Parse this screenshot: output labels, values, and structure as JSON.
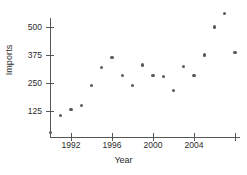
{
  "chart_data": {
    "type": "scatter",
    "title": "",
    "xlabel": "Year",
    "ylabel": "Imports",
    "xlim": [
      1989.4,
      2008.6
    ],
    "ylim": [
      0,
      580
    ],
    "grid": false,
    "legend": null,
    "xticks": [
      1992,
      1996,
      2000,
      2004,
      2008
    ],
    "xtick_labels": [
      "1992",
      "1996",
      "2000",
      "2004",
      ""
    ],
    "yticks": [
      125,
      250,
      375,
      500
    ],
    "ytick_labels": [
      "125",
      "250",
      "375",
      "500"
    ],
    "marker": {
      "shape": "circle",
      "color": "#5a5a5a",
      "size": 3.2
    },
    "points": [
      {
        "x": 1990,
        "y": 30
      },
      {
        "x": 1991,
        "y": 105
      },
      {
        "x": 1992,
        "y": 130
      },
      {
        "x": 1993,
        "y": 148
      },
      {
        "x": 1994,
        "y": 238
      },
      {
        "x": 1995,
        "y": 320
      },
      {
        "x": 1996,
        "y": 365
      },
      {
        "x": 1997,
        "y": 285
      },
      {
        "x": 1998,
        "y": 240
      },
      {
        "x": 1999,
        "y": 330
      },
      {
        "x": 2000,
        "y": 285
      },
      {
        "x": 2001,
        "y": 278
      },
      {
        "x": 2002,
        "y": 215
      },
      {
        "x": 2003,
        "y": 325
      },
      {
        "x": 2004,
        "y": 285
      },
      {
        "x": 2005,
        "y": 375
      },
      {
        "x": 2006,
        "y": 500
      },
      {
        "x": 2007,
        "y": 560
      },
      {
        "x": 2008,
        "y": 385
      }
    ],
    "colors": {
      "axis": "#555555",
      "text": "#2b2b2b",
      "marker": "#5a5a5a",
      "background": "#ffffff"
    }
  }
}
